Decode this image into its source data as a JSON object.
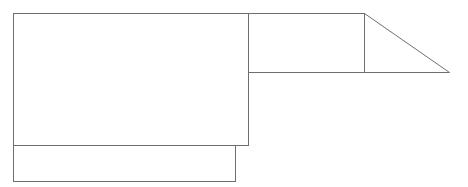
{
  "diagram": {
    "stroke_color": "#6e6e6e",
    "background": "#ffffff",
    "shapes": [
      {
        "id": "main-rect",
        "type": "rect",
        "x": 13,
        "y": 13,
        "w": 235,
        "h": 132
      },
      {
        "id": "bottom-rect",
        "type": "rect",
        "x": 13,
        "y": 145,
        "w": 222,
        "h": 36
      },
      {
        "id": "right-rect",
        "type": "rect",
        "x": 248,
        "y": 13,
        "w": 116,
        "h": 59
      },
      {
        "id": "triangle",
        "type": "polygon",
        "points": "364,13 449,72 364,72"
      }
    ]
  }
}
